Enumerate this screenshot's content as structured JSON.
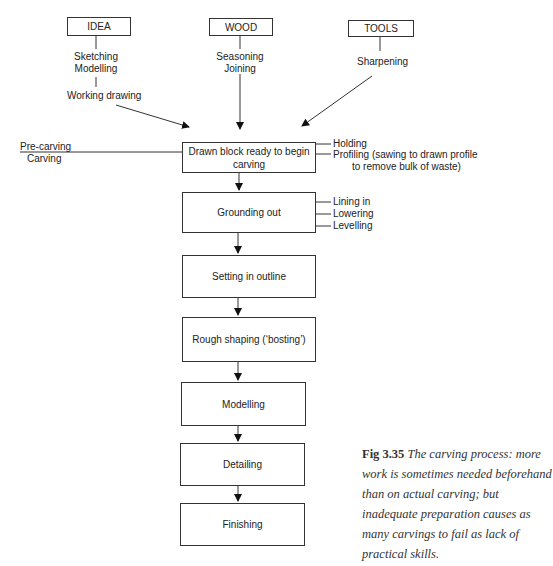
{
  "inputs": {
    "idea": {
      "label": "IDEA",
      "steps": [
        "Sketching",
        "Modelling"
      ],
      "substep": "Working drawing"
    },
    "wood": {
      "label": "WOOD",
      "steps": [
        "Seasoning",
        "Joining"
      ]
    },
    "tools": {
      "label": "TOOLS",
      "steps": [
        "Sharpening"
      ]
    }
  },
  "phases": {
    "pre_carving": "Pre-carving",
    "carving": "Carving"
  },
  "stages": [
    {
      "label": "Drawn block ready to begin carving",
      "notes": [
        "Holding",
        "Profiling (sawing to drawn profile",
        "to remove bulk of waste)"
      ]
    },
    {
      "label": "Grounding out",
      "notes": [
        "Lining in",
        "Lowering",
        "Levelling"
      ]
    },
    {
      "label": "Setting in outline"
    },
    {
      "label": "Rough shaping (‘bosting’)"
    },
    {
      "label": "Modelling"
    },
    {
      "label": "Detailing"
    },
    {
      "label": "Finishing"
    }
  ],
  "caption": {
    "figure": "Fig 3.35",
    "text": "The carving process: more work is sometimes needed beforehand than on actual carving; but inadequate preparation causes as many carvings to fail as lack of practical skills."
  }
}
